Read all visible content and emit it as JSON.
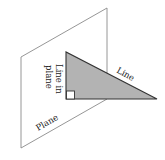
{
  "diagram": {
    "type": "geometry",
    "labels": {
      "plane": "Plane",
      "line_in_plane_1": "Line in",
      "line_in_plane_2": "plane",
      "line": "Line"
    },
    "colors": {
      "plane_stroke": "#8a8a8a",
      "triangle_fill": "#b3b3b3",
      "triangle_stroke": "#333333",
      "right_angle_fill": "#ffffff",
      "text": "#222222"
    },
    "shapes": {
      "plane": {
        "kind": "parallelogram",
        "points": [
          [
            21,
            57
          ],
          [
            107,
            8
          ],
          [
            107,
            99
          ],
          [
            21,
            148
          ]
        ]
      },
      "triangle": {
        "kind": "right-triangle",
        "points": [
          [
            66,
            52
          ],
          [
            66,
            99
          ],
          [
            157,
            99
          ]
        ],
        "right_angle_at": [
          66,
          99
        ]
      },
      "right_angle_marker": {
        "x": 66,
        "y": 91,
        "size": 8
      }
    }
  }
}
